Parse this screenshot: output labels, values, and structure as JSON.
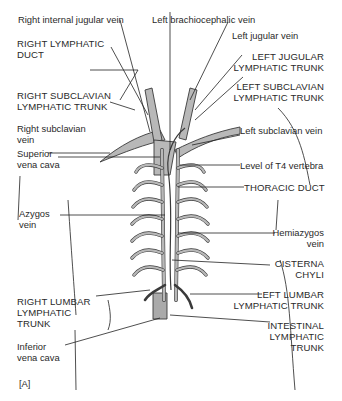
{
  "figure_tag": "[A]",
  "colors": {
    "vessel_fill": "#b8b8b8",
    "vessel_stroke": "#3a3a3a",
    "leader_line": "#222222",
    "text": "#2a2a2a"
  },
  "labels": {
    "right_internal_jugular_vein": "Right internal jugular vein",
    "left_brachiocephalic_vein": "Left brachiocephalic vein",
    "right_lymphatic_duct_1": "RIGHT LYMPHATIC",
    "right_lymphatic_duct_2": "DUCT",
    "left_jugular_vein": "Left jugular vein",
    "left_jugular_trunk_1": "LEFT JUGULAR",
    "left_jugular_trunk_2": "LYMPHATIC TRUNK",
    "right_subclavian_trunk_1": "RIGHT SUBCLAVIAN",
    "right_subclavian_trunk_2": "LYMPHATIC TRUNK",
    "left_subclavian_trunk_1": "LEFT SUBCLAVIAN",
    "left_subclavian_trunk_2": "LYMPHATIC TRUNK",
    "right_subclavian_vein_1": "Right subclavian",
    "right_subclavian_vein_2": "vein",
    "left_subclavian_vein": "Left subclavian vein",
    "superior_vena_cava_1": "Superior",
    "superior_vena_cava_2": "vena cava",
    "level_t4": "Level of T4 vertebra",
    "thoracic_duct": "THORACIC DUCT",
    "azygos_1": "Azygos",
    "azygos_2": "vein",
    "hemiazygos_1": "Hemiazygos",
    "hemiazygos_2": "vein",
    "cisterna_1": "CISTERNA",
    "cisterna_2": "CHYLI",
    "right_lumbar_1": "RIGHT LUMBAR",
    "right_lumbar_2": "LYMPHATIC",
    "right_lumbar_3": "TRUNK",
    "left_lumbar_1": "LEFT LUMBAR",
    "left_lumbar_2": "LYMPHATIC TRUNK",
    "ivc_1": "Inferior",
    "ivc_2": "vena cava",
    "intestinal_1": "INTESTINAL",
    "intestinal_2": "LYMPHATIC",
    "intestinal_3": "TRUNK"
  }
}
